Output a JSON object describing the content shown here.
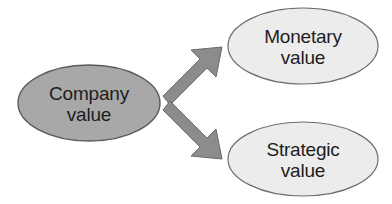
{
  "diagram": {
    "type": "concept-map",
    "background_color": "#ffffff",
    "nodes": [
      {
        "id": "company-value",
        "role": "source",
        "lines": [
          "Company",
          "value"
        ],
        "fill": "#a8a8a8",
        "stroke": "#5a5a5a",
        "text_color": "#1d1d1d",
        "cx": 89,
        "cy": 103,
        "rx": 71,
        "ry": 38
      },
      {
        "id": "monetary-value",
        "role": "target",
        "lines": [
          "Monetary",
          "value"
        ],
        "fill": "#ececec",
        "stroke": "#6e6e6e",
        "text_color": "#1d1d1d",
        "cx": 303,
        "cy": 46,
        "rx": 75,
        "ry": 38
      },
      {
        "id": "strategic-value",
        "role": "target",
        "lines": [
          "Strategic",
          "value"
        ],
        "fill": "#ececec",
        "stroke": "#6e6e6e",
        "text_color": "#1d1d1d",
        "cx": 303,
        "cy": 159,
        "rx": 75,
        "ry": 37
      }
    ],
    "edges": [
      {
        "id": "edge-company-to-monetary",
        "from": "company-value",
        "to": "monetary-value",
        "direction": "up-right",
        "fill": "#8c8c8c",
        "stroke": "#6a6a6a"
      },
      {
        "id": "edge-company-to-strategic",
        "from": "company-value",
        "to": "strategic-value",
        "direction": "down-right",
        "fill": "#8c8c8c",
        "stroke": "#6a6a6a"
      }
    ]
  }
}
